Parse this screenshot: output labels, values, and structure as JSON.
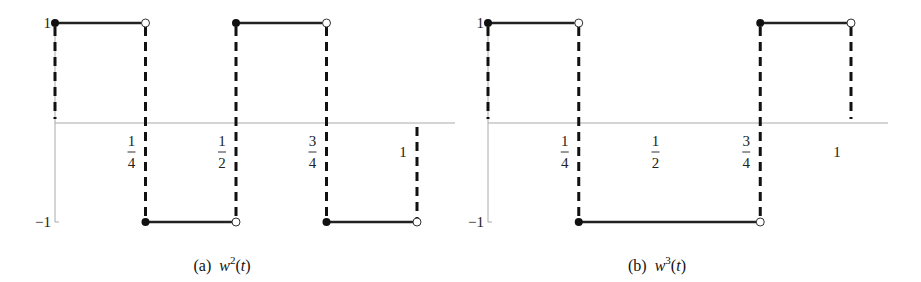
{
  "chart_data": [
    {
      "type": "line",
      "subtype": "step",
      "title": "",
      "caption": {
        "prefix": "(a)",
        "func": "w",
        "sup": "2",
        "arg": "(t)"
      },
      "xlabel": "",
      "ylabel": "",
      "xlim": [
        0,
        1
      ],
      "ylim": [
        -1,
        1
      ],
      "grid": false,
      "x_ticks": [
        {
          "value": 0.25,
          "num": "1",
          "den": "4"
        },
        {
          "value": 0.5,
          "num": "1",
          "den": "2"
        },
        {
          "value": 0.75,
          "num": "3",
          "den": "4"
        },
        {
          "value": 1,
          "label": "1"
        }
      ],
      "y_ticks": [
        {
          "value": 1,
          "label": "1"
        },
        {
          "value": -1,
          "label": "−1"
        }
      ],
      "segments": [
        {
          "x0": 0,
          "x1": 0.25,
          "y": 1,
          "closed_left": true,
          "open_right": true
        },
        {
          "x0": 0.25,
          "x1": 0.5,
          "y": -1,
          "closed_left": true,
          "open_right": true
        },
        {
          "x0": 0.5,
          "x1": 0.75,
          "y": 1,
          "closed_left": true,
          "open_right": true
        },
        {
          "x0": 0.75,
          "x1": 1,
          "y": -1,
          "closed_left": true,
          "open_right": true
        }
      ],
      "dashed_verticals": [
        0,
        0.25,
        0.5,
        0.75,
        1
      ]
    },
    {
      "type": "line",
      "subtype": "step",
      "title": "",
      "caption": {
        "prefix": "(b)",
        "func": "w",
        "sup": "3",
        "arg": "(t)"
      },
      "xlabel": "",
      "ylabel": "",
      "xlim": [
        0,
        1
      ],
      "ylim": [
        -1,
        1
      ],
      "grid": false,
      "x_ticks": [
        {
          "value": 0.25,
          "num": "1",
          "den": "4"
        },
        {
          "value": 0.5,
          "num": "1",
          "den": "2"
        },
        {
          "value": 0.75,
          "num": "3",
          "den": "4"
        },
        {
          "value": 1,
          "label": "1"
        }
      ],
      "y_ticks": [
        {
          "value": 1,
          "label": "1"
        },
        {
          "value": -1,
          "label": "−1"
        }
      ],
      "segments": [
        {
          "x0": 0,
          "x1": 0.25,
          "y": 1,
          "closed_left": true,
          "open_right": true
        },
        {
          "x0": 0.25,
          "x1": 0.75,
          "y": -1,
          "closed_left": true,
          "open_right": true
        },
        {
          "x0": 0.75,
          "x1": 1,
          "y": 1,
          "closed_left": true,
          "open_right": true
        }
      ],
      "dashed_verticals": [
        0,
        0.25,
        0.75,
        1
      ]
    }
  ]
}
